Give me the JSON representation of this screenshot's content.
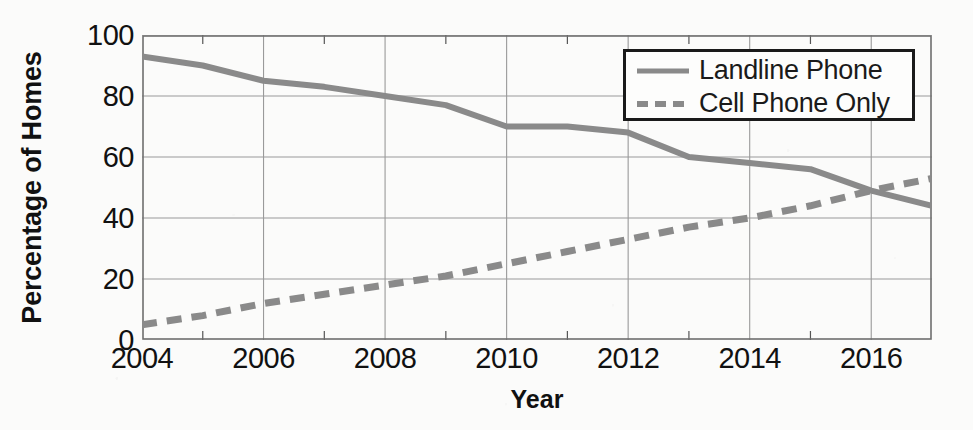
{
  "chart_data": {
    "type": "line",
    "title": "",
    "xlabel": "Year",
    "ylabel": "Percentage of Homes",
    "xlim": [
      2004,
      2017
    ],
    "ylim": [
      0,
      100
    ],
    "grid": true,
    "legend_position": "top-right",
    "x": [
      2004,
      2005,
      2006,
      2007,
      2008,
      2009,
      2010,
      2011,
      2012,
      2013,
      2014,
      2015,
      2016,
      2017
    ],
    "x_tick_labels": [
      "2004",
      "2006",
      "2008",
      "2010",
      "2012",
      "2014",
      "2016"
    ],
    "x_ticks": [
      2004,
      2006,
      2008,
      2010,
      2012,
      2014,
      2016
    ],
    "x_minor_ticks": [
      2005,
      2007,
      2009,
      2011,
      2013,
      2015,
      2017
    ],
    "y_tick_labels": [
      "0",
      "20",
      "40",
      "60",
      "80",
      "100"
    ],
    "y_ticks": [
      0,
      20,
      40,
      60,
      80,
      100
    ],
    "series": [
      {
        "name": "Landline Phone",
        "style": "solid",
        "color": "#8a8a8a",
        "values": [
          93,
          90,
          85,
          83,
          80,
          77,
          70,
          70,
          68,
          60,
          58,
          56,
          49,
          44
        ]
      },
      {
        "name": "Cell Phone Only",
        "style": "dashed",
        "color": "#8a8a8a",
        "values": [
          5,
          8,
          12,
          15,
          18,
          21,
          25,
          29,
          33,
          37,
          40,
          44,
          49,
          53
        ]
      }
    ]
  },
  "legend": {
    "items": [
      {
        "label": "Landline Phone",
        "swatch": "solid-line-swatch"
      },
      {
        "label": "Cell Phone Only",
        "swatch": "dashed-line-swatch"
      }
    ]
  },
  "axes": {
    "y_title": "Percentage of Homes",
    "x_title": "Year"
  },
  "colors": {
    "line": "#8a8a8a",
    "grid": "#9a9a9a",
    "axis": "#555555",
    "text": "#111111",
    "background": "#fbfbfa",
    "legend_border": "#1a1a1a"
  }
}
